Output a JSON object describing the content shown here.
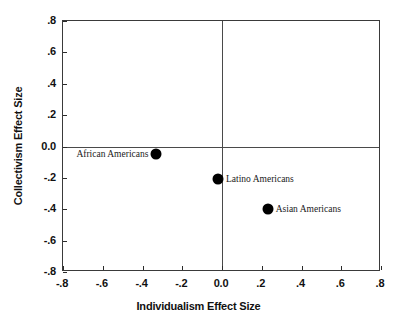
{
  "chart_data": {
    "type": "scatter",
    "title": "",
    "xlabel": "Individualism Effect Size",
    "ylabel": "Collectivism Effect Size",
    "xlim": [
      -0.8,
      0.8
    ],
    "ylim": [
      -0.8,
      0.8
    ],
    "xticks": [
      -0.8,
      -0.6,
      -0.4,
      -0.2,
      0.0,
      0.2,
      0.4,
      0.6,
      0.8
    ],
    "yticks": [
      0.8,
      0.6,
      0.4,
      0.2,
      0.0,
      -0.2,
      -0.4,
      -0.6,
      -0.8
    ],
    "xticklabels": [
      "-.8",
      "-.6",
      "-.4",
      "-.2",
      "0.0",
      ".2",
      ".4",
      ".6",
      ".8"
    ],
    "yticklabels": [
      ".8",
      ".6",
      ".4",
      ".2",
      "0.0",
      "-.2",
      "-.4",
      "-.6",
      "-.8"
    ],
    "grid": false,
    "legend": "none",
    "reference_lines": {
      "x": 0.0,
      "y": 0.0
    },
    "points": [
      {
        "label": "African Americans",
        "x": -0.33,
        "y": -0.05,
        "label_side": "left"
      },
      {
        "label": "Latino Americans",
        "x": -0.02,
        "y": -0.21,
        "label_side": "right"
      },
      {
        "label": "Asian Americans",
        "x": 0.23,
        "y": -0.4,
        "label_side": "right"
      }
    ],
    "marker_color": "#000000",
    "frame_color": "#3a3a3a"
  }
}
